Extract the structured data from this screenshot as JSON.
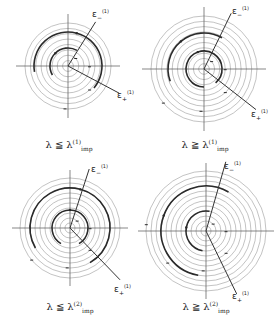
{
  "figure": {
    "panels": [
      {
        "id": "top-left",
        "center": [
          68,
          66
        ],
        "outer_radius": 43,
        "ring_count": 8,
        "axis_extent": 52,
        "epsilon_minus": {
          "angle_deg": -58,
          "length": 52,
          "label": "ε",
          "sub": "−",
          "sup": "(1)",
          "label_pos": [
            92,
            8
          ]
        },
        "epsilon_plus": {
          "angle_deg": 28,
          "length": 58,
          "label": "ε",
          "sub": "+",
          "sup": "(1)",
          "label_pos": [
            117,
            89
          ]
        },
        "bold_rings": [
          {
            "r": 34,
            "from": 170,
            "to": 400
          },
          {
            "r": 18,
            "from": 150,
            "to": 300
          }
        ],
        "caption": {
          "lhs": "λ",
          "rel": "≦",
          "rhs": "λ",
          "sup": "(1)",
          "sub": "imp",
          "pos": [
            69,
            138
          ]
        }
      },
      {
        "id": "top-right",
        "center": [
          204,
          69
        ],
        "outer_radius": 53,
        "ring_count": 10,
        "axis_extent": 62,
        "epsilon_minus": {
          "angle_deg": -64,
          "length": 62,
          "label": "ε",
          "sub": "−",
          "sup": "(1)",
          "label_pos": [
            232,
            5
          ]
        },
        "epsilon_plus": {
          "angle_deg": 38,
          "length": 66,
          "label": "ε",
          "sub": "+",
          "sup": "(1)",
          "label_pos": [
            251,
            108
          ]
        },
        "bold_rings": [
          {
            "r": 36,
            "from": 160,
            "to": 300
          },
          {
            "r": 18,
            "from": 90,
            "to": 410
          }
        ],
        "caption": {
          "lhs": "λ",
          "rel": "≧",
          "rhs": "λ",
          "sup": "(1)",
          "sub": "imp",
          "pos": [
            205,
            138
          ]
        }
      },
      {
        "id": "bottom-left",
        "center": [
          70,
          228
        ],
        "outer_radius": 50,
        "ring_count": 10,
        "axis_extent": 58,
        "epsilon_minus": {
          "angle_deg": -72,
          "length": 62,
          "label": "ε",
          "sub": "−",
          "sup": "(1)",
          "label_pos": [
            91,
            163
          ]
        },
        "epsilon_plus": {
          "angle_deg": 46,
          "length": 72,
          "label": "ε",
          "sub": "+",
          "sup": "(1)",
          "label_pos": [
            114,
            283
          ]
        },
        "bold_rings": [
          {
            "r": 40,
            "from": 150,
            "to": 420
          },
          {
            "r": 18,
            "from": 120,
            "to": 420
          }
        ],
        "caption": {
          "lhs": "λ",
          "rel": "≦",
          "rhs": "λ",
          "sup": "(2)",
          "sub": "imp",
          "pos": [
            70,
            300
          ]
        }
      },
      {
        "id": "bottom-right",
        "center": [
          206,
          231
        ],
        "outer_radius": 60,
        "ring_count": 12,
        "axis_extent": 68,
        "epsilon_minus": {
          "angle_deg": -74,
          "length": 72,
          "label": "ε",
          "sub": "−",
          "sup": "(1)",
          "label_pos": [
            224,
            160
          ]
        },
        "epsilon_plus": {
          "angle_deg": 64,
          "length": 70,
          "label": "ε",
          "sub": "+",
          "sup": "(1)",
          "label_pos": [
            232,
            290
          ]
        },
        "bold_rings": [
          {
            "r": 45,
            "from": 100,
            "to": 300
          },
          {
            "r": 20,
            "from": 100,
            "to": 280
          }
        ],
        "caption": {
          "lhs": "λ",
          "rel": "≧",
          "rhs": "λ",
          "sup": "(2)",
          "sub": "imp",
          "pos": [
            206,
            300
          ]
        }
      }
    ],
    "colors": {
      "ring": "#9a9a9a",
      "bold_ring": "#2a2a2a",
      "axis": "#555555",
      "ray": "#333333",
      "background": "#ffffff"
    }
  }
}
